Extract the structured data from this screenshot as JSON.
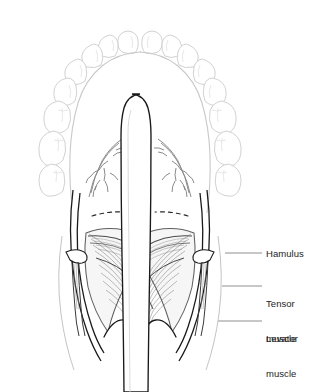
{
  "figure": {
    "background_color": "#ffffff",
    "width": 331,
    "height": 392
  },
  "style": {
    "teeth_stroke": "#d2d2d2",
    "arch_stroke": "#c9c9c9",
    "outline_stroke": "#1a1a1a",
    "muscle_stroke": "#6a6a6a",
    "muscle_fill": "#f2f2f2",
    "vessel_stroke": "#8a8a8a",
    "leader_stroke": "#8f8f8f",
    "dashed_stroke": "#2a2a2a",
    "label_color": "#1d1d1d"
  },
  "labels": [
    {
      "id": "hamulus",
      "text": "Hamulus",
      "lines": [
        "Hamulus"
      ],
      "x": 266,
      "y": 248,
      "leader": {
        "x1": 225,
        "y1": 253,
        "x2": 262,
        "y2": 253
      }
    },
    {
      "id": "tensor-muscle",
      "text": "Tensor muscle",
      "lines": [
        "Tensor",
        "muscle"
      ],
      "x": 266,
      "y": 281,
      "leader": {
        "x1": 222,
        "y1": 286,
        "x2": 262,
        "y2": 286
      }
    },
    {
      "id": "levator-muscle",
      "text": "Levator muscle",
      "lines": [
        "Levator",
        "muscle"
      ],
      "x": 266,
      "y": 316,
      "leader": {
        "x1": 218,
        "y1": 321,
        "x2": 262,
        "y2": 321
      }
    }
  ],
  "anatomy": {
    "dental_arch": "maxillary teeth, light gray outline, 16 teeth",
    "central_structure": "vomer / nasal septum, rounded anterior tip",
    "vessels": "greater palatine vessel branches, both sides",
    "dashed_markers": "hard palate / soft palate junction, both sides",
    "muscles": "tensor veli palatini and levator veli palatini, striated fan",
    "posterior_edge": "scalloped posterior free margin of soft palate"
  }
}
